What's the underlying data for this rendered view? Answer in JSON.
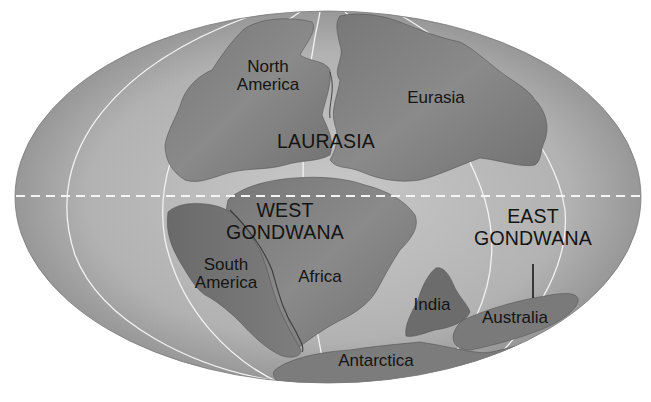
{
  "map": {
    "projection": "elliptical (Mollweide-style) world map",
    "colors": {
      "ocean": "#b4b4b4",
      "ocean_edge": "#8a8a8a",
      "land_dark": "#6e6e6e",
      "land_mid": "#858585",
      "graticule": "#f2f2f2",
      "equator": "#f5f5f5",
      "label_text": "#141414",
      "background": "#ffffff"
    },
    "supercontinents": {
      "laurasia": "LAURASIA",
      "west_gondwana": [
        "WEST",
        "GONDWANA"
      ],
      "east_gondwana": [
        "EAST",
        "GONDWANA"
      ]
    },
    "continents": {
      "north_america": [
        "North",
        "America"
      ],
      "eurasia": "Eurasia",
      "south_america": [
        "South",
        "America"
      ],
      "africa": "Africa",
      "india": "India",
      "australia": "Australia",
      "antarctica": "Antarctica"
    },
    "equator_style": "dashed"
  }
}
